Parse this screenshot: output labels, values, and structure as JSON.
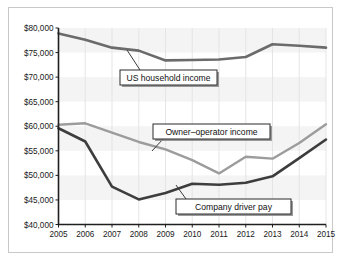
{
  "chart_data": {
    "type": "line",
    "title": "",
    "subtitle": "",
    "xlabel": "",
    "ylabel": "",
    "x": [
      2005,
      2006,
      2007,
      2008,
      2009,
      2010,
      2011,
      2012,
      2013,
      2014,
      2015
    ],
    "categories": [
      "2005",
      "2006",
      "2007",
      "2008",
      "2009",
      "2010",
      "2011",
      "2012",
      "2013",
      "2014",
      "2015"
    ],
    "xlim": [
      2005,
      2015
    ],
    "ylim": [
      40000,
      80000
    ],
    "yticks": [
      40000,
      45000,
      50000,
      55000,
      60000,
      65000,
      70000,
      75000,
      80000
    ],
    "ytick_labels": [
      "$40,000",
      "$45,000",
      "$50,000",
      "$55,000",
      "$60,000",
      "$65,000",
      "$70,000",
      "$75,000",
      "$80,000"
    ],
    "xtick_labels": [
      "2005",
      "2006",
      "2007",
      "2008",
      "2009",
      "2010",
      "2011",
      "2012",
      "2013",
      "2014",
      "2015"
    ],
    "grid": "vertical",
    "legend": "inline-annotations",
    "series": [
      {
        "name": "US household income",
        "color": "#6b6b6b",
        "width": 2.6,
        "values": [
          78900,
          77600,
          76000,
          75400,
          73400,
          73500,
          73600,
          74100,
          76700,
          76400,
          76000
        ]
      },
      {
        "name": "Owner-operator income",
        "color": "#9c9c9c",
        "width": 2.4,
        "values": [
          60300,
          60600,
          58700,
          56800,
          55300,
          53100,
          50400,
          53800,
          53400,
          56600,
          60400
        ]
      },
      {
        "name": "Company driver pay",
        "color": "#3d3d3d",
        "width": 2.6,
        "values": [
          59600,
          56900,
          47700,
          45100,
          46400,
          48300,
          48100,
          48500,
          49800,
          53500,
          57300
        ]
      }
    ],
    "annotations": [
      {
        "name": "us-household-income",
        "text": "US household income",
        "box_x": 120,
        "box_y": 70,
        "box_w": 97,
        "box_h": 15,
        "leader_from_x": 140,
        "leader_from_y": 70,
        "leader_to_x": 127,
        "leader_to_y": 50
      },
      {
        "name": "owner-operator-income",
        "text": "Owner–operator income",
        "box_x": 153,
        "box_y": 124,
        "box_w": 117,
        "box_h": 15,
        "leader_from_x": 163,
        "leader_from_y": 139,
        "leader_to_x": 152,
        "leader_to_y": 151
      },
      {
        "name": "company-driver-pay",
        "text": "Company driver pay",
        "box_x": 176,
        "box_y": 199,
        "box_w": 115,
        "box_h": 15,
        "leader_from_x": 186,
        "leader_from_y": 199,
        "leader_to_x": 176,
        "leader_to_y": 185
      }
    ]
  }
}
